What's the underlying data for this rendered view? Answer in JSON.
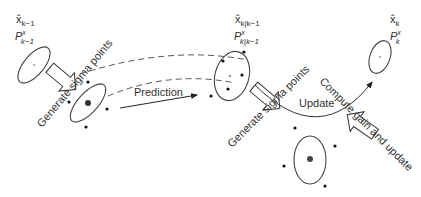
{
  "diagram": {
    "states": {
      "prior": {
        "mean": "x̂",
        "mean_sub": "k−1",
        "cov": "P",
        "cov_sup": "x",
        "cov_sub": "k−1"
      },
      "predicted": {
        "mean": "x̂",
        "mean_sub": "k|k−1",
        "cov": "P",
        "cov_sup": "x",
        "cov_sub": "k|k−1"
      },
      "posterior": {
        "mean": "x̂",
        "mean_sub": "k",
        "cov": "P",
        "cov_sup": "x",
        "cov_sub": "k"
      }
    },
    "labels": {
      "generate_sigma_1": "Generate sigma points",
      "prediction": "Prediction",
      "generate_sigma_2": "Generate sigma points",
      "update": "Update",
      "compute_gain": "Compute gain and update"
    },
    "colors": {
      "stroke": "#333333",
      "fill": "#111111",
      "center": "#999999"
    }
  }
}
